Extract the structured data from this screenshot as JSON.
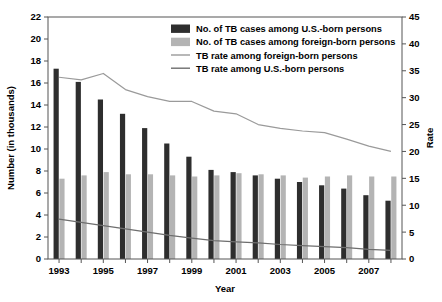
{
  "chart_data": {
    "type": "bar",
    "title": "",
    "xlabel": "Year",
    "ylabel": "Number (in thousands)",
    "y2label": "Rate",
    "categories": [
      1993,
      1994,
      1995,
      1996,
      1997,
      1998,
      1999,
      2000,
      2001,
      2002,
      2003,
      2004,
      2005,
      2006,
      2007,
      2008
    ],
    "tick_labels_x": [
      "1993",
      "1995",
      "1997",
      "1999",
      "2001",
      "2003",
      "2005",
      "2007"
    ],
    "tick_values_x": [
      1993,
      1995,
      1997,
      1999,
      2001,
      2003,
      2005,
      2007
    ],
    "ylim": [
      0,
      22
    ],
    "yticks": [
      0,
      2,
      4,
      6,
      8,
      10,
      12,
      14,
      16,
      18,
      20,
      22
    ],
    "y2lim": [
      0,
      45
    ],
    "y2ticks": [
      0,
      5,
      10,
      15,
      20,
      25,
      30,
      35,
      40,
      45
    ],
    "grid": false,
    "legend_position": "top-right",
    "series": [
      {
        "name": "No. of TB cases among U.S.-born persons",
        "kind": "bar",
        "axis": "left",
        "color": "#2e2e2e",
        "values": [
          17.3,
          16.1,
          14.5,
          13.2,
          11.9,
          10.5,
          9.3,
          8.1,
          7.9,
          7.6,
          7.3,
          7.0,
          6.7,
          6.4,
          5.8,
          5.3
        ]
      },
      {
        "name": "No. of TB cases among foreign-born persons",
        "kind": "bar",
        "axis": "left",
        "color": "#b4b4b4",
        "values": [
          7.3,
          7.6,
          7.9,
          7.7,
          7.7,
          7.6,
          7.5,
          7.6,
          7.8,
          7.7,
          7.6,
          7.4,
          7.5,
          7.6,
          7.5,
          7.5
        ]
      },
      {
        "name": "TB rate among foreign-born persons",
        "kind": "line",
        "axis": "right",
        "color": "#9a9a9a",
        "values": [
          33.8,
          33.3,
          34.5,
          31.5,
          30.2,
          29.3,
          29.3,
          27.5,
          27.0,
          25.0,
          24.3,
          23.8,
          23.5,
          22.3,
          21.0,
          20.0
        ]
      },
      {
        "name": "TB rate among U.S.-born persons",
        "kind": "line",
        "axis": "right",
        "color": "#6e6e6e",
        "values": [
          7.4,
          6.8,
          6.2,
          5.6,
          5.0,
          4.4,
          3.9,
          3.4,
          3.2,
          3.0,
          2.7,
          2.5,
          2.3,
          2.1,
          1.8,
          1.6
        ]
      }
    ]
  },
  "legend": {
    "items": [
      {
        "label": "No. of TB cases among U.S.-born persons",
        "swatch": "bar",
        "color": "#2e2e2e"
      },
      {
        "label": "No. of TB cases among foreign-born persons",
        "swatch": "bar",
        "color": "#b4b4b4"
      },
      {
        "label": "TB rate among foreign-born persons",
        "swatch": "line",
        "color": "#9a9a9a"
      },
      {
        "label": "TB rate among U.S.-born persons",
        "swatch": "line",
        "color": "#6e6e6e"
      }
    ]
  }
}
